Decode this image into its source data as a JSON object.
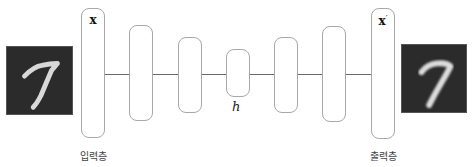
{
  "diagram": {
    "type": "autoencoder",
    "input_image": {
      "digit": "7",
      "description": "MNIST digit 7 (original)"
    },
    "output_image": {
      "digit": "7",
      "description": "MNIST digit 7 (reconstructed, blurrier)"
    },
    "layers": [
      {
        "id": "input",
        "symbol": "x",
        "caption": "입력층"
      },
      {
        "id": "enc1"
      },
      {
        "id": "enc2"
      },
      {
        "id": "code",
        "symbol": "h"
      },
      {
        "id": "dec1"
      },
      {
        "id": "dec2"
      },
      {
        "id": "output",
        "symbol": "x",
        "prime": "′",
        "caption": "출력층"
      }
    ],
    "colors": {
      "box_border": "#a8a8a8",
      "line": "#6a6a6a",
      "image_bg": "#2b2b2b",
      "digit_stroke": "#e0e0e0"
    }
  }
}
